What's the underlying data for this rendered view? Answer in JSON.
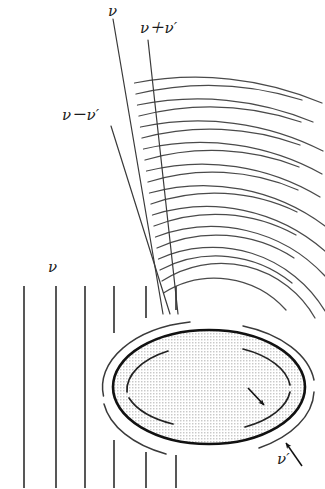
{
  "figure": {
    "background_color": "#ffffff",
    "stroke_color": "#333333",
    "heavy_stroke_color": "#111111",
    "fill_pattern_color": "#d9d9d9",
    "width": 325,
    "height": 489
  },
  "labels": {
    "radial_nu": "ν",
    "radial_nu_plus_nu_prime": "ν＋ν′",
    "radial_nu_minus_nu_prime": "ν－ν′",
    "plane_wave_nu": "ν",
    "rotation_nu_prime": "ν′"
  },
  "elements": {
    "plane_wavefronts": {
      "name": "vertical plane wavefront lines",
      "count": 6,
      "x_positions": [
        24,
        56,
        85,
        114,
        146,
        176
      ],
      "y_top": 285,
      "y_bottom": 489
    },
    "radial_lines": {
      "name": "radial frequency boundary lines",
      "count": 3,
      "labels": [
        "ν",
        "ν－ν′",
        "ν＋ν′"
      ]
    },
    "circular_wavefronts": {
      "name": "scattered circular wavefront arcs",
      "count": 20,
      "origin_x": 209,
      "origin_y": 387
    },
    "ellipse": {
      "name": "rotating elliptical scatterer",
      "center_x": 209,
      "center_y": 387,
      "radius_x": 96,
      "radius_y": 57,
      "fill": "stippled gray",
      "rotation_direction": "clockwise"
    },
    "inner_arrow": {
      "name": "rotation direction arrow on inner arc"
    },
    "outer_arrow": {
      "name": "pointer arrow from nu-prime label to outer arc"
    }
  }
}
